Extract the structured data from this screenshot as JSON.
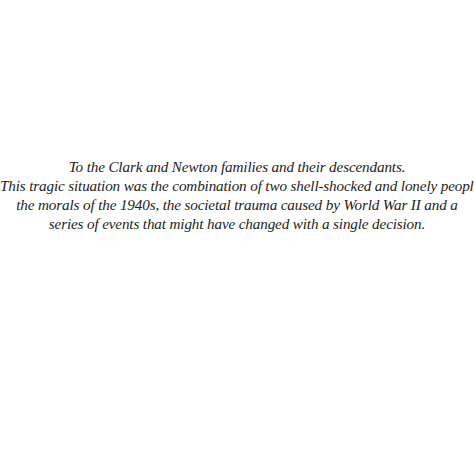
{
  "dedication": {
    "lines": [
      "To the Clark and Newton families and their descendants.",
      "This tragic situation was the combination of two shell-shocked and lonely people,",
      "the morals of the 1940s, the societal trauma caused by World War II and a",
      "series of events that might have changed with a single decision."
    ]
  }
}
